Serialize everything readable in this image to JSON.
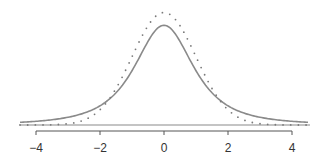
{
  "chart_data": {
    "type": "line",
    "title": "",
    "xlabel": "",
    "ylabel": "",
    "xlim": [
      -4.5,
      4.5
    ],
    "xticks": [
      -4,
      -2,
      0,
      2,
      4
    ],
    "xtick_labels": [
      "−4",
      "−2",
      "0",
      "2",
      "4"
    ],
    "grid": false,
    "legend": "none",
    "series": [
      {
        "name": "t-distribution (df=2)",
        "style": "solid",
        "color": "#8a8a8a",
        "distribution": "t",
        "df": 2
      },
      {
        "name": "normal distribution",
        "style": "dotted",
        "color": "#8a8a8a",
        "distribution": "normal",
        "mean": 0,
        "sd": 1
      }
    ]
  }
}
